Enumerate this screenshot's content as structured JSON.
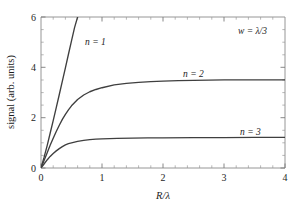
{
  "chart_data": {
    "type": "line",
    "title": "",
    "xlabel": "R/λ",
    "ylabel": "signal (arb. units)",
    "xlim": [
      0,
      4
    ],
    "ylim": [
      0,
      6
    ],
    "xticks": [
      0,
      1,
      2,
      3,
      4
    ],
    "xticklabels": [
      "0",
      "1",
      "2",
      "3",
      "4"
    ],
    "yticks": [
      0,
      2,
      4,
      6
    ],
    "yticklabels": [
      "0",
      "2",
      "4",
      "6"
    ],
    "grid": false,
    "legend_position": "inline-annotations",
    "annotations": [
      {
        "text": "w = λ/3",
        "x": 3.35,
        "y": 5.35
      }
    ],
    "series": [
      {
        "name": "n = 1",
        "label": "n = 1",
        "label_x": 0.72,
        "label_y": 5.05,
        "color": "#3f3f3f",
        "x": [
          0,
          0.05,
          0.1,
          0.15,
          0.2,
          0.25,
          0.3,
          0.35,
          0.4,
          0.45,
          0.5,
          0.55,
          0.6,
          0.62
        ],
        "y": [
          0,
          0.42,
          0.88,
          1.38,
          1.88,
          2.4,
          2.92,
          3.45,
          3.98,
          4.52,
          5.05,
          5.58,
          6.0,
          6.2
        ]
      },
      {
        "name": "n = 2",
        "label": "n = 2",
        "label_x": 2.3,
        "label_y": 3.95,
        "color": "#3f3f3f",
        "x": [
          0,
          0.05,
          0.1,
          0.15,
          0.2,
          0.25,
          0.3,
          0.35,
          0.4,
          0.45,
          0.5,
          0.6,
          0.7,
          0.8,
          0.9,
          1.0,
          1.2,
          1.4,
          1.6,
          1.8,
          2.0,
          2.25,
          2.5,
          2.75,
          3.0,
          3.25,
          3.5,
          3.75,
          4.0
        ],
        "y": [
          0,
          0.3,
          0.6,
          0.9,
          1.18,
          1.45,
          1.7,
          1.93,
          2.13,
          2.31,
          2.47,
          2.72,
          2.9,
          3.03,
          3.12,
          3.19,
          3.3,
          3.36,
          3.4,
          3.43,
          3.45,
          3.47,
          3.48,
          3.49,
          3.5,
          3.5,
          3.5,
          3.5,
          3.5
        ]
      },
      {
        "name": "n = 3",
        "label": "n = 3",
        "label_x": 3.35,
        "label_y": 1.72,
        "color": "#3f3f3f",
        "x": [
          0,
          0.05,
          0.1,
          0.15,
          0.2,
          0.25,
          0.3,
          0.35,
          0.4,
          0.45,
          0.5,
          0.6,
          0.7,
          0.8,
          0.9,
          1.0,
          1.25,
          1.5,
          1.75,
          2.0,
          2.5,
          3.0,
          3.5,
          4.0
        ],
        "y": [
          0,
          0.16,
          0.32,
          0.46,
          0.58,
          0.68,
          0.77,
          0.85,
          0.92,
          0.97,
          1.0,
          1.06,
          1.1,
          1.13,
          1.15,
          1.16,
          1.18,
          1.19,
          1.2,
          1.2,
          1.21,
          1.21,
          1.22,
          1.22
        ]
      }
    ]
  },
  "axes": {
    "x_title": "R/λ",
    "y_title": "signal (arb. units)"
  }
}
